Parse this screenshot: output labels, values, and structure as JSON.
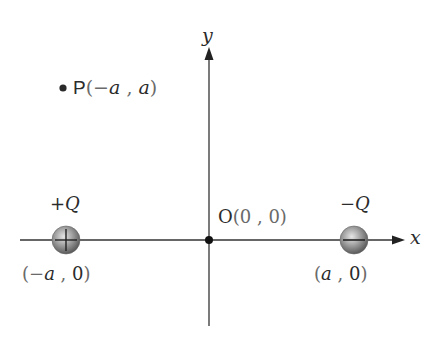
{
  "diagram": {
    "type": "coordinate-plane-point-charges",
    "axes": {
      "x_label": "x",
      "y_label": "y",
      "origin_label": "O",
      "origin_coords": "(0 , 0)",
      "stroke_color": "#333333"
    },
    "point_P": {
      "name": "P",
      "coords_open": "(",
      "coord_x_sign": "−",
      "coord_x": "a",
      "sep": " , ",
      "coord_y": "a",
      "coords_close": ")"
    },
    "charges": [
      {
        "id": "positive-charge",
        "label": "+Q",
        "sign_symbol": "+",
        "position_label": "(−a , 0)",
        "pos_open": "(",
        "pos_x_sign": "−",
        "pos_x": "a",
        "pos_sep": " , ",
        "pos_y": "0",
        "pos_close": ")"
      },
      {
        "id": "negative-charge",
        "label": "−Q",
        "sign_symbol": "−",
        "position_label": "(a , 0)",
        "pos_open": "(",
        "pos_x": "a",
        "pos_sep": " , ",
        "pos_y": "0",
        "pos_close": ")"
      }
    ],
    "colors": {
      "sphere_light": "#d8d8d8",
      "sphere_mid": "#9a9a9a",
      "sphere_dark": "#555555",
      "dot": "#111111",
      "text": "#2b2b2b"
    }
  }
}
